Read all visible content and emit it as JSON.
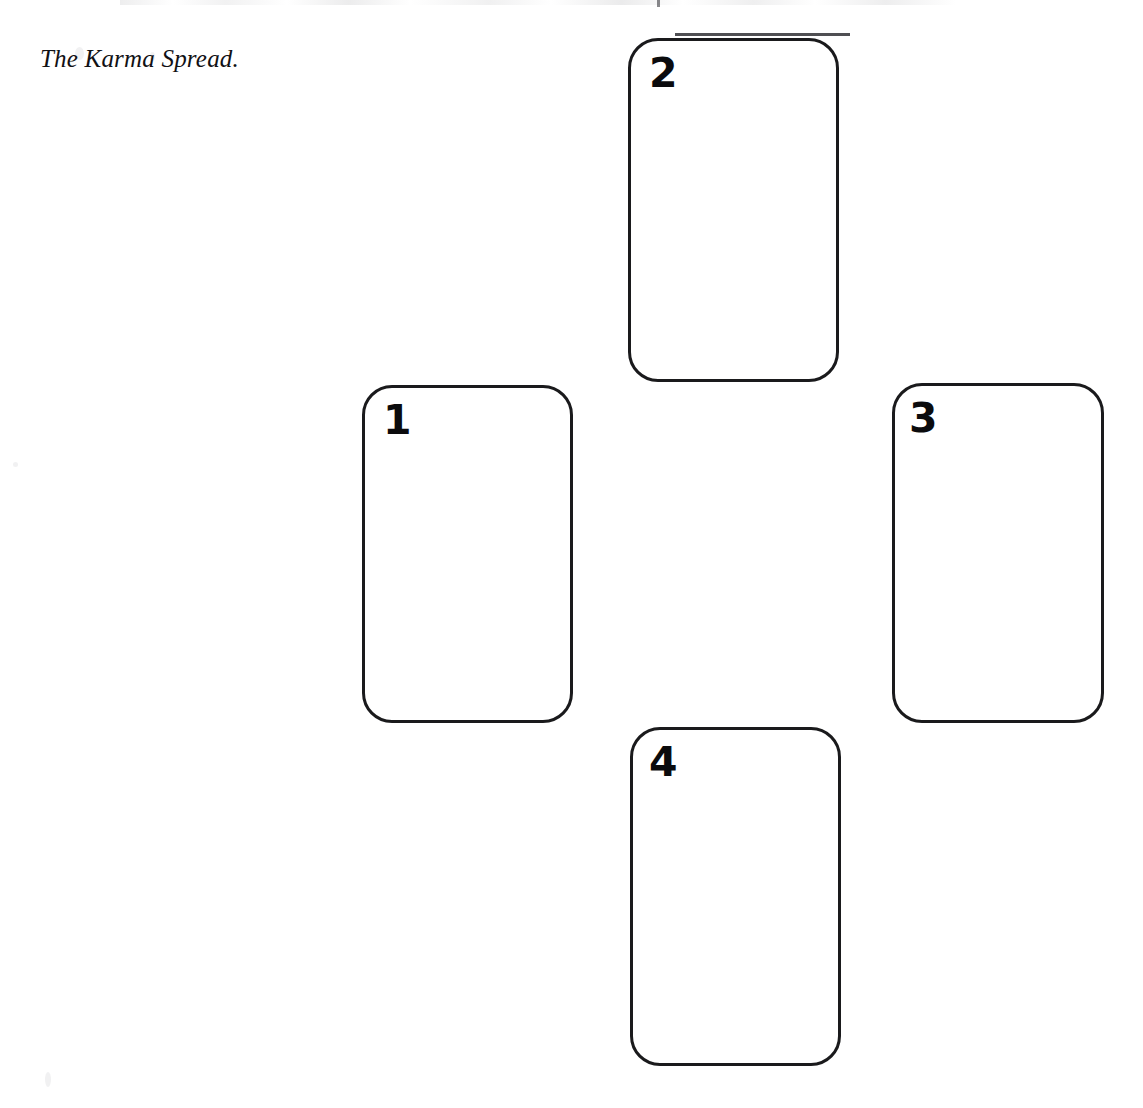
{
  "page": {
    "background_color": "#ffffff",
    "ink_color": "#1a1a1c",
    "width": 1143,
    "height": 1108
  },
  "caption": {
    "text": "The Karma Spread."
  },
  "spread": {
    "name": "The Karma Spread",
    "layout": "cross",
    "card_count": 4,
    "cards": [
      {
        "number": "1",
        "position_label": "left",
        "x": 362,
        "y": 385,
        "width": 211,
        "height": 338
      },
      {
        "number": "2",
        "position_label": "top",
        "x": 628,
        "y": 38,
        "width": 211,
        "height": 344
      },
      {
        "number": "3",
        "position_label": "right",
        "x": 892,
        "y": 383,
        "width": 212,
        "height": 340
      },
      {
        "number": "4",
        "position_label": "bottom",
        "x": 630,
        "y": 727,
        "width": 211,
        "height": 339
      }
    ]
  }
}
